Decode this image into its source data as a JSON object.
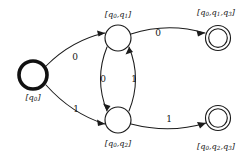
{
  "diagram": {
    "type": "finite-state-automaton",
    "background_color": "#ffffff",
    "stroke_color": "#1b1b1b",
    "alphabet": [
      "0",
      "1"
    ],
    "states": [
      {
        "id": "q0",
        "label": "[q0]",
        "label_text": "[q",
        "label_sub": "0",
        "label_tail": "]",
        "kind": "start",
        "accepting": false,
        "cx": 33,
        "cy": 75,
        "r": 14.5,
        "label_x": 33,
        "label_y": 97
      },
      {
        "id": "q0q1",
        "label": "[q0,q1]",
        "kind": "normal",
        "accepting": false,
        "cx": 118,
        "cy": 38,
        "r": 13,
        "label_x": 118,
        "label_y": 15
      },
      {
        "id": "q0q2",
        "label": "[q0,q2]",
        "kind": "normal",
        "accepting": false,
        "cx": 118,
        "cy": 120,
        "r": 13,
        "label_x": 118,
        "label_y": 143
      },
      {
        "id": "q0q1q3",
        "label": "[q0,q1,q3]",
        "kind": "accept",
        "accepting": true,
        "cx": 218,
        "cy": 38,
        "r": 12.5,
        "r_inner": 9.5,
        "label_x": 216,
        "label_y": 13
      },
      {
        "id": "q0q2q3",
        "label": "[q0,q2,q3]",
        "kind": "accept",
        "accepting": true,
        "cx": 218,
        "cy": 118,
        "r": 12.5,
        "r_inner": 9.5,
        "label_x": 216,
        "label_y": 147
      }
    ],
    "transitions": [
      {
        "id": "t-start-top",
        "from": "q0",
        "to": "q0q1",
        "symbol": "0",
        "label_x": 75,
        "label_y": 57
      },
      {
        "id": "t-start-bottom",
        "from": "q0",
        "to": "q0q2",
        "symbol": "1",
        "label_x": 76,
        "label_y": 109
      },
      {
        "id": "t-top-down",
        "from": "q0q1",
        "to": "q0q2",
        "symbol": "0",
        "label_x": 103,
        "label_y": 79
      },
      {
        "id": "t-bottom-up",
        "from": "q0q2",
        "to": "q0q1",
        "symbol": "1",
        "label_x": 133,
        "label_y": 79
      },
      {
        "id": "t-top-accept",
        "from": "q0q1",
        "to": "q0q1q3",
        "symbol": "0",
        "label_x": 158,
        "label_y": 34
      },
      {
        "id": "t-bottom-accept",
        "from": "q0q2",
        "to": "q0q2q3",
        "symbol": "1",
        "label_x": 169,
        "label_y": 118
      }
    ]
  }
}
